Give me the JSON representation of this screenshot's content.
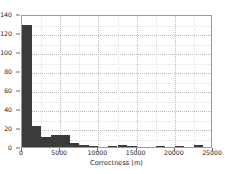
{
  "chart_data": {
    "type": "bar",
    "title": "",
    "xlabel": "Correctness (m)",
    "ylabel": "",
    "xlim": [
      0,
      25000
    ],
    "ylim": [
      0,
      140
    ],
    "grid": true,
    "legend": null,
    "bar_color": "#3b3b3b",
    "bin_width": 1250,
    "xticks": [
      0,
      5000,
      10000,
      15000,
      20000,
      25000
    ],
    "xticklabels": [
      "0",
      "5000",
      "10000",
      "15000",
      "20000",
      "25000"
    ],
    "yticks": [
      0,
      20,
      40,
      60,
      80,
      100,
      120,
      140
    ],
    "yticklabels": [
      "0",
      "20",
      "40",
      "60",
      "80",
      "100",
      "120",
      "140"
    ],
    "bin_edges": [
      0,
      1250,
      2500,
      3750,
      5000,
      6250,
      7500,
      8750,
      10000,
      11250,
      12500,
      13750,
      15000,
      16250,
      17500,
      18750,
      20000,
      21250,
      22500,
      23750,
      25000
    ],
    "x": [
      625,
      1875,
      3125,
      4375,
      5625,
      6875,
      8125,
      9375,
      10625,
      11875,
      13125,
      14375,
      15625,
      16875,
      18125,
      19375,
      20625,
      21875,
      23125,
      24375
    ],
    "values": [
      128,
      22,
      11,
      13,
      13,
      4,
      2,
      1,
      0,
      1,
      2,
      1,
      0,
      0,
      1,
      0,
      1,
      0,
      2,
      0
    ]
  },
  "axes": {
    "xlabel": "Correctness (m)"
  }
}
